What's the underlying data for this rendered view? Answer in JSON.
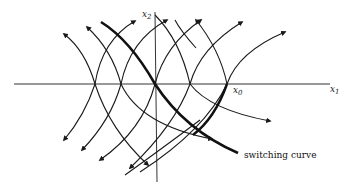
{
  "figure": {
    "axes": {
      "x_label": "x",
      "x_label_sub": "1",
      "y_label": "x",
      "y_label_sub": "2"
    },
    "point_label": "x",
    "point_label_sub": "0",
    "switching_curve_label": "switching curve",
    "colors": {
      "ink": "#1a1a1a",
      "axis": "#333333",
      "background": "#ffffff"
    },
    "trajectory_axis_crossings_px": [
      95,
      121,
      155,
      190,
      227
    ]
  }
}
